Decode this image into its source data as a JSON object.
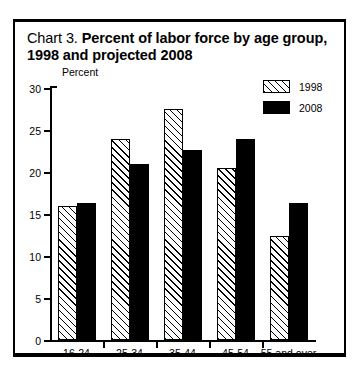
{
  "title": {
    "prefix": "Chart 3.",
    "bold_line1": " Percent of labor force by age group,",
    "bold_line2": "1998 and projected 2008"
  },
  "axis": {
    "y_label": "Percent",
    "y_ticks": [
      "30",
      "25",
      "20",
      "15",
      "10",
      "5",
      "0"
    ]
  },
  "legend": {
    "items": [
      {
        "label": "1998",
        "swatch": "hatched-diagonal-swatch"
      },
      {
        "label": "2008",
        "swatch": "solid-black-swatch"
      }
    ]
  },
  "chart_data": {
    "type": "bar",
    "title": "Chart 3. Percent of labor force by age group, 1998 and projected 2008",
    "xlabel": "",
    "ylabel": "Percent",
    "ylim": [
      0,
      30
    ],
    "ytick_step": 5,
    "grid": false,
    "legend_position": "top-right",
    "categories": [
      "16-24",
      "25-34",
      "35-44",
      "45-54",
      "55 and over"
    ],
    "series": [
      {
        "name": "1998",
        "values": [
          15.9,
          23.9,
          27.5,
          20.5,
          12.4
        ]
      },
      {
        "name": "2008",
        "values": [
          16.3,
          20.9,
          22.6,
          23.9,
          16.3
        ]
      }
    ]
  },
  "colors": {
    "series_1998": "#ffffff",
    "series_2008": "#000000",
    "outline": "#000000",
    "background": "#ffffff"
  }
}
